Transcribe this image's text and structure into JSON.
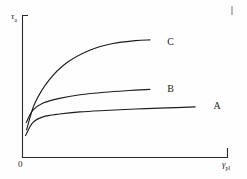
{
  "figure": {
    "background_color": "#fefefe",
    "ink_color": "#1d1d1d"
  },
  "axes": {
    "origin_label": "0",
    "y_axis": {
      "symbol": "τ",
      "subscript": "a",
      "label_full": "τa"
    },
    "x_axis": {
      "symbol": "γ",
      "subscript": "pl",
      "label_full": "γpl"
    }
  },
  "chart_data": {
    "type": "line",
    "title": "",
    "subtitle": "",
    "xlabel": "γpl",
    "ylabel": "τa",
    "xlim": [
      0,
      1
    ],
    "ylim": [
      0,
      1
    ],
    "grid": false,
    "legend": "inline-curve-labels",
    "xticks": [
      "0"
    ],
    "yticks": [],
    "annotations": [
      {
        "text": "A",
        "x": 0.9,
        "y": 0.355
      },
      {
        "text": "B",
        "x": 0.675,
        "y": 0.475
      },
      {
        "text": "C",
        "x": 0.675,
        "y": 0.805
      }
    ],
    "series": [
      {
        "name": "A",
        "label": "A",
        "color": "#1d1d1d",
        "x": [
          0.015,
          0.05,
          0.1,
          0.18,
          0.28,
          0.4,
          0.55,
          0.7,
          0.84
        ],
        "y": [
          0.155,
          0.245,
          0.285,
          0.305,
          0.32,
          0.33,
          0.34,
          0.348,
          0.355
        ]
      },
      {
        "name": "B",
        "label": "B",
        "color": "#1d1d1d",
        "x": [
          0.018,
          0.05,
          0.1,
          0.18,
          0.28,
          0.4,
          0.52,
          0.62
        ],
        "y": [
          0.245,
          0.33,
          0.382,
          0.415,
          0.44,
          0.458,
          0.47,
          0.478
        ]
      },
      {
        "name": "C",
        "label": "C",
        "color": "#1d1d1d",
        "x": [
          0.02,
          0.06,
          0.13,
          0.22,
          0.33,
          0.44,
          0.55,
          0.62
        ],
        "y": [
          0.195,
          0.38,
          0.545,
          0.67,
          0.755,
          0.8,
          0.82,
          0.825
        ]
      }
    ]
  }
}
